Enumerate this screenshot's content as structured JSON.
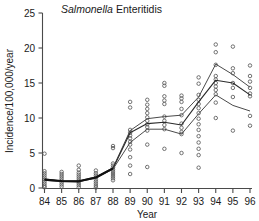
{
  "chart_data": {
    "type": "scatter",
    "title": "Salmonella Enteritidis",
    "title_italic_word": "Salmonella",
    "title_plain_word": "Enteritidis",
    "xlabel": "Year",
    "ylabel": "Incidence/100,000/year",
    "xlim": [
      84,
      96
    ],
    "ylim": [
      0,
      25
    ],
    "xticks": [
      "84",
      "85",
      "86",
      "87",
      "88",
      "89",
      "90",
      "91",
      "92",
      "93",
      "94",
      "95",
      "96"
    ],
    "yticks": [
      "0",
      "5",
      "10",
      "15",
      "20",
      "25"
    ],
    "grid": false,
    "legend": "none",
    "point_marker": "open-circle",
    "x": [
      84,
      85,
      86,
      87,
      88,
      89,
      90,
      91,
      92,
      93,
      94,
      95,
      96
    ],
    "scatter_points": [
      {
        "year": 84,
        "values": [
          4.9,
          2.4,
          2.1,
          1.8,
          1.5,
          1.2,
          0.9,
          0.6,
          0.3,
          0.1
        ]
      },
      {
        "year": 85,
        "values": [
          2.3,
          2.0,
          1.7,
          1.4,
          1.1,
          0.8,
          0.5,
          0.2
        ]
      },
      {
        "year": 86,
        "values": [
          3.2,
          2.6,
          2.2,
          1.9,
          1.6,
          1.3,
          1.0,
          0.7,
          0.4,
          0.1
        ]
      },
      {
        "year": 87,
        "values": [
          2.5,
          2.1,
          1.8,
          1.5,
          1.2,
          0.9,
          0.6,
          0.3,
          0.05
        ]
      },
      {
        "year": 88,
        "values": [
          6.0,
          5.7,
          3.5,
          3.2,
          2.9,
          2.6,
          2.3,
          2.0,
          1.7,
          1.4,
          1.1
        ]
      },
      {
        "year": 89,
        "values": [
          12.3,
          11.5,
          8.3,
          7.9,
          7.5,
          7.1,
          6.6,
          6.2,
          5.5,
          4.4,
          3.2,
          2.0
        ]
      },
      {
        "year": 90,
        "values": [
          12.6,
          11.9,
          11.3,
          10.7,
          10.1,
          9.6,
          9.1,
          8.7,
          8.2,
          6.2,
          3.0
        ]
      },
      {
        "year": 91,
        "values": [
          15.0,
          14.6,
          13.1,
          12.5,
          12.0,
          10.2,
          9.6,
          9.0,
          8.4,
          5.6
        ]
      },
      {
        "year": 92,
        "values": [
          13.2,
          12.8,
          12.3,
          11.3,
          10.4,
          9.2,
          8.6,
          8.0,
          7.7,
          5.0
        ]
      },
      {
        "year": 93,
        "values": [
          15.8,
          14.9,
          13.3,
          12.6,
          12.0,
          11.4,
          10.7,
          9.9,
          9.1,
          8.3,
          7.4,
          6.5,
          5.6,
          4.7,
          2.9
        ]
      },
      {
        "year": 94,
        "values": [
          20.5,
          19.4,
          17.6,
          16.0,
          15.5,
          15.0,
          14.5,
          14.0,
          13.4,
          12.2,
          10.0
        ]
      },
      {
        "year": 95,
        "values": [
          20.2,
          17.1,
          16.4,
          15.0,
          14.3,
          13.0,
          8.2
        ]
      },
      {
        "year": 96,
        "values": [
          17.5,
          16.0,
          15.2,
          14.3,
          13.5,
          13.1,
          10.3,
          8.9
        ]
      }
    ],
    "series": [
      {
        "name": "upper-bound",
        "values": [
          1.3,
          1.0,
          1.0,
          1.6,
          2.9,
          8.2,
          9.9,
          10.2,
          10.4,
          13.0,
          17.7,
          16.2,
          14.4
        ]
      },
      {
        "name": "median-fit",
        "values": [
          1.2,
          1.0,
          0.95,
          1.5,
          2.8,
          7.9,
          9.2,
          9.4,
          9.0,
          12.3,
          15.4,
          15.0,
          13.3
        ]
      },
      {
        "name": "lower-bound",
        "values": [
          1.1,
          0.9,
          0.9,
          1.4,
          2.7,
          6.5,
          8.4,
          8.4,
          7.7,
          10.6,
          13.3,
          11.8,
          11.0
        ]
      }
    ]
  }
}
